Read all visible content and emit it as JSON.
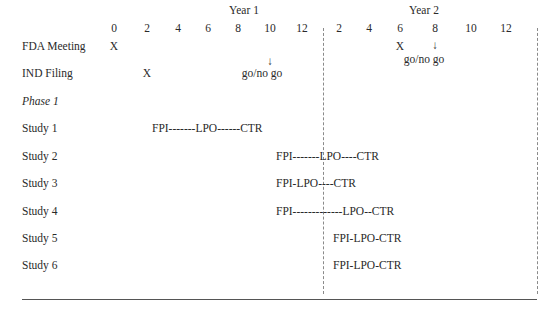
{
  "header": {
    "year1": "Year 1",
    "year2": "Year 2",
    "year1_ticks": [
      "0",
      "2",
      "4",
      "6",
      "8",
      "10",
      "12"
    ],
    "year2_ticks": [
      "2",
      "4",
      "6",
      "8",
      "10",
      "12"
    ]
  },
  "rows": {
    "fda": {
      "label": "FDA Meeting",
      "mark1": "X",
      "mark2": "X",
      "arrow1": "↓",
      "arrow2": "↓",
      "gonogo2": "go/no go"
    },
    "ind": {
      "label": "IND Filing",
      "mark1": "X",
      "gonogo1": "go/no go"
    },
    "phase": {
      "label": "Phase 1"
    },
    "study1": {
      "label": "Study 1",
      "timeline": "FPI-------LPO------CTR"
    },
    "study2": {
      "label": "Study 2",
      "timeline": "FPI-------LPO----CTR"
    },
    "study3": {
      "label": "Study 3",
      "timeline": "FPI-LPO----CTR"
    },
    "study4": {
      "label": "Study 4",
      "timeline": "FPI-------------LPO--CTR"
    },
    "study5": {
      "label": "Study 5",
      "timeline": "FPI-LPO-CTR"
    },
    "study6": {
      "label": "Study 6",
      "timeline": "FPI-LPO-CTR"
    }
  }
}
